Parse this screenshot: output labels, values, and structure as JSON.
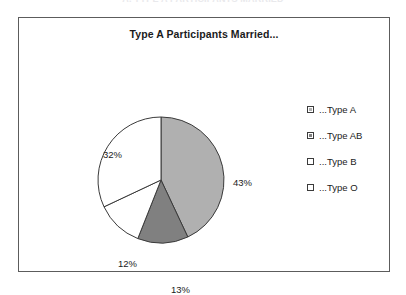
{
  "clipped_caption": "A. TYPE A PARTICIPANTS MARRIED",
  "chart_data": {
    "type": "pie",
    "title": "Type A Participants Married...",
    "xlabel": "",
    "ylabel": "",
    "grid": false,
    "legend_position": "right",
    "start_angle_deg": 0,
    "direction": "clockwise",
    "categories": [
      "...Type A",
      "...Type AB",
      "...Type B",
      "...Type O"
    ],
    "values": [
      43,
      13,
      12,
      32
    ],
    "value_unit": "%",
    "data_labels": [
      "43%",
      "13%",
      "12%",
      "32%"
    ],
    "slice_colors": [
      "#b0b0b0",
      "#808080",
      "#ffffff",
      "#ffffff"
    ],
    "slice_border_color": "#3a3a3a",
    "slices": [
      {
        "label": "...Type A",
        "value": 43,
        "data_label": "43%",
        "color": "#b0b0b0"
      },
      {
        "label": "...Type AB",
        "value": 13,
        "data_label": "13%",
        "color": "#808080"
      },
      {
        "label": "...Type B",
        "value": 12,
        "data_label": "12%",
        "color": "#ffffff"
      },
      {
        "label": "...Type O",
        "value": 32,
        "data_label": "32%",
        "color": "#ffffff"
      }
    ]
  },
  "legend": {
    "items": [
      {
        "label": "...Type A",
        "color": "#b0b0b0"
      },
      {
        "label": "...Type AB",
        "color": "#808080"
      },
      {
        "label": "...Type B",
        "color": "#ffffff"
      },
      {
        "label": "...Type O",
        "color": "#ffffff"
      }
    ]
  },
  "colors": {
    "frame_border": "#5c5c5c",
    "text": "#1b1b1b",
    "background": "#ffffff"
  }
}
